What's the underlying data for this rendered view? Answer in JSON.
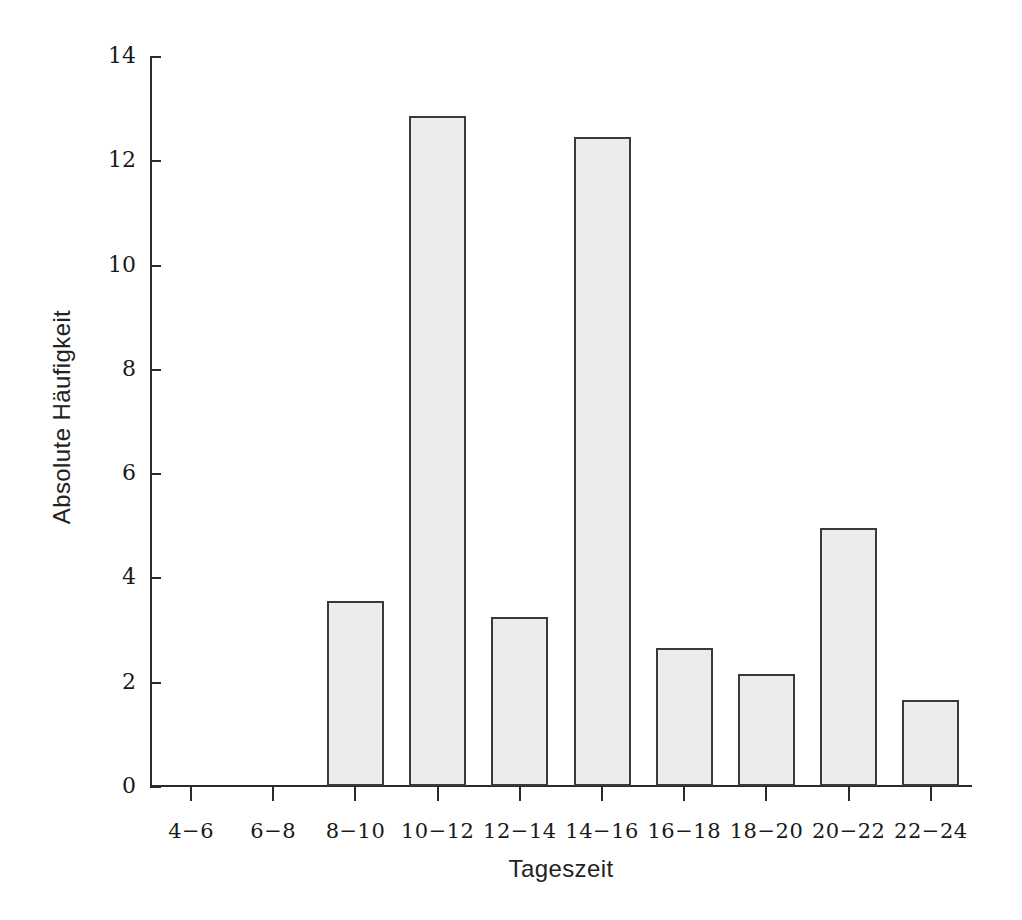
{
  "chart_data": {
    "type": "bar",
    "title": "",
    "xlabel": "Tageszeit",
    "ylabel": "Absolute Häufigkeit",
    "categories": [
      "4−6",
      "6−8",
      "8−10",
      "10−12",
      "12−14",
      "14−16",
      "16−18",
      "18−20",
      "20−22",
      "22−24"
    ],
    "values": [
      0,
      0,
      3.55,
      12.85,
      3.25,
      12.45,
      2.65,
      2.15,
      4.95,
      1.65
    ],
    "ylim": [
      0,
      14
    ],
    "ytick_labels": [
      "0",
      "2",
      "4",
      "6",
      "8",
      "10",
      "12",
      "14"
    ],
    "ytick_values": [
      0,
      2,
      4,
      6,
      8,
      10,
      12,
      14
    ],
    "grid": false,
    "legend": false,
    "bar_fill_color": "#ebedec",
    "bar_edge_color": "#3a3a3a",
    "axis_color": "#2b2b2b",
    "background_color": "#ffffff"
  }
}
